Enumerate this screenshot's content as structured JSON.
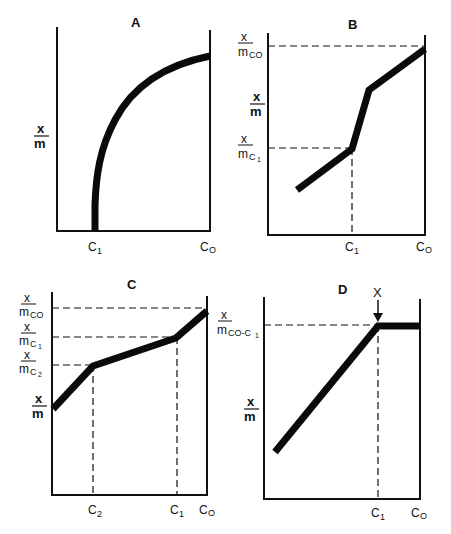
{
  "figure": {
    "panels": [
      {
        "id": "A",
        "title": "A",
        "y_label": {
          "num": "x",
          "den": "m"
        },
        "x_ticks": [
          {
            "label": "C",
            "sub": "1"
          },
          {
            "label": "C",
            "sub": "O"
          }
        ],
        "y_ticks": []
      },
      {
        "id": "B",
        "title": "B",
        "y_label": {
          "num": "x",
          "den": "m"
        },
        "x_ticks": [
          {
            "label": "C",
            "sub": "1"
          },
          {
            "label": "C",
            "sub": "O"
          }
        ],
        "y_ticks": [
          {
            "num": "x",
            "den": "m",
            "sub": "CO"
          },
          {
            "num": "x",
            "den": "m",
            "sub": "C1"
          }
        ]
      },
      {
        "id": "C",
        "title": "C",
        "y_label": {
          "num": "x",
          "den": "m"
        },
        "x_ticks": [
          {
            "label": "C",
            "sub": "2"
          },
          {
            "label": "C",
            "sub": "1"
          },
          {
            "label": "C",
            "sub": "O"
          }
        ],
        "y_ticks": [
          {
            "num": "x",
            "den": "m",
            "sub": "CO"
          },
          {
            "num": "x",
            "den": "m",
            "sub": "C1"
          },
          {
            "num": "x",
            "den": "m",
            "sub": "C2"
          }
        ]
      },
      {
        "id": "D",
        "title": "D",
        "y_label": {
          "num": "x",
          "den": "m"
        },
        "x_ticks": [
          {
            "label": "C",
            "sub": "1"
          },
          {
            "label": "C",
            "sub": "O"
          }
        ],
        "y_ticks": [
          {
            "num": "x",
            "den": "m",
            "sub": "CO-C1"
          }
        ],
        "annotation": {
          "label": "X",
          "type": "arrow-down"
        }
      }
    ]
  },
  "text": {
    "A": "A",
    "B": "B",
    "C": "C",
    "D": "D",
    "x": "x",
    "m": "m",
    "Cmain": "C",
    "s1": "1",
    "s2": "2",
    "sO": "O",
    "mC": "m",
    "subCO": "CO",
    "subC": "C",
    "subCOC": "CO-C",
    "X": "X"
  }
}
